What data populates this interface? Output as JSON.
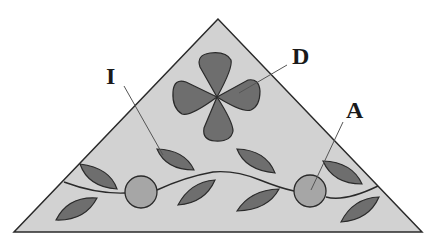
{
  "diagram": {
    "shape": "triangle",
    "colors": {
      "background": "#ffffff",
      "triangle_fill": "#d2d2d2",
      "outline": "#2a2a2a",
      "petal_fill": "#6e6e6e",
      "leaf_fill": "#6e6e6e",
      "circle_fill": "#a6a6a6",
      "leader_line": "#555555"
    },
    "labels": [
      {
        "id": "I",
        "text": "I",
        "points_to": "leaf"
      },
      {
        "id": "D",
        "text": "D",
        "points_to": "four-petal flower"
      },
      {
        "id": "A",
        "text": "A",
        "points_to": "circle"
      }
    ]
  }
}
